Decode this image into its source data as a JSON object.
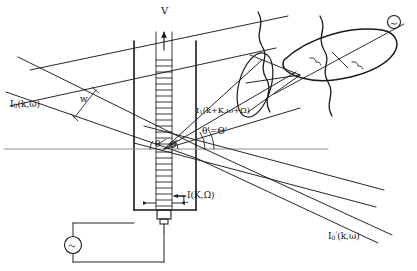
{
  "figure": {
    "type": "schematic-diagram",
    "background_color": "#ffffff",
    "line_color": "#1a1a1a",
    "axis_color": "#8a8a8a",
    "width": 417,
    "height": 271
  },
  "labels": {
    "velocity": "V",
    "incident_beam": "I",
    "incident_beam_sub": "0",
    "incident_beam_args": "(k,ω)",
    "beam_width": "w",
    "scattered_beam": "I",
    "scattered_beam_sub": "1",
    "scattered_beam_args": "(k+K,ω+Ω)",
    "angle_inside": "θ",
    "angle_inside_cap": "Θ",
    "angle_outside_prime": "θ'=Θ'",
    "acoustic_wave": "I(K,Ω)",
    "interaction_length": "L",
    "transmitted_beam": "I",
    "transmitted_beam_sub": "0",
    "transmitted_beam_prime": "'",
    "transmitted_beam_args": "(k,ω)",
    "detector_symbol": "S",
    "source_symbol": "~"
  },
  "components": {
    "cell_name": "liquid cell / tank",
    "transducer_name": "piezoelectric transducer",
    "lens_name": "collecting lens",
    "source_name": "rf signal generator",
    "detector_name": "photodetector",
    "acoustic_column_name": "acoustic wave column",
    "optical_axis_name": "optical axis"
  }
}
